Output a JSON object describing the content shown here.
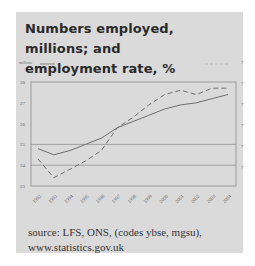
{
  "title": "Numbers employed, millions;  and employment rate, %",
  "title_lines": [
    "Numbers employed, millions;  and",
    "employment rate, %"
  ],
  "legend": {
    "left_label": "millions",
    "left_series_style": "solid",
    "right_series_style": "dashed"
  },
  "source_lines": [
    "source: LFS, ONS, (codes ybse, mgsu),",
    "www.statistics.gov.uk"
  ],
  "colors": {
    "panel_bg": "#dadada",
    "line": "#6e6e6e",
    "grid": "#8a8a8a",
    "text": "#2a2a2a"
  },
  "chart_data": {
    "type": "line",
    "title": "Numbers employed, millions;  and employment rate, %",
    "categories": [
      "1992",
      "1993",
      "1994",
      "1995",
      "1996",
      "1997",
      "1998",
      "1999",
      "2000",
      "2001",
      "2002",
      "2003",
      "2004"
    ],
    "series": [
      {
        "name": "Numbers employed (millions)",
        "axis": "left",
        "style": "solid",
        "values": [
          24.8,
          24.5,
          24.7,
          25.0,
          25.3,
          25.8,
          26.1,
          26.4,
          26.7,
          26.9,
          27.0,
          27.2,
          27.4
        ]
      },
      {
        "name": "Employment rate (%)",
        "axis": "right",
        "style": "dashed",
        "values": [
          71.3,
          70.4,
          70.8,
          71.2,
          71.7,
          72.8,
          73.3,
          73.9,
          74.4,
          74.6,
          74.4,
          74.7,
          74.7
        ]
      }
    ],
    "left_axis": {
      "label": "millions",
      "ticks": [
        28,
        27,
        26,
        25,
        24,
        23
      ],
      "ylim": [
        23,
        28
      ]
    },
    "right_axis": {
      "label": "%",
      "ticks_visible_prefix": "7",
      "ylim": [
        70,
        75
      ],
      "note": "labels truncated at image edge"
    },
    "xlabel": "",
    "ylabel": "millions",
    "grid": "horizontal lines at 24 and 25",
    "legend_position": "top"
  }
}
